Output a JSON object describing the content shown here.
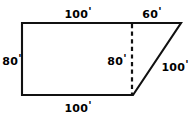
{
  "figure": {
    "unit_symbol": "'",
    "stroke_color": "#000000",
    "background_color": "#ffffff",
    "labels": {
      "top_left": {
        "value": "100",
        "unit": "'"
      },
      "top_right": {
        "value": "60",
        "unit": "'"
      },
      "left_side": {
        "value": "80",
        "unit": "'"
      },
      "inner_dashed": {
        "value": "80",
        "unit": "'"
      },
      "slant_side": {
        "value": "100",
        "unit": "'"
      },
      "bottom": {
        "value": "100",
        "unit": "'"
      }
    },
    "geometry": {
      "rect_top_left": [
        22,
        23
      ],
      "rect_top_right": [
        133,
        23
      ],
      "rect_bottom_right": [
        133,
        95
      ],
      "rect_bottom_left": [
        22,
        95
      ],
      "apex_top_right": [
        181,
        23
      ],
      "dashed_line_x": 132,
      "dashed_line_from_y": 24,
      "dashed_line_to_y": 95
    }
  }
}
